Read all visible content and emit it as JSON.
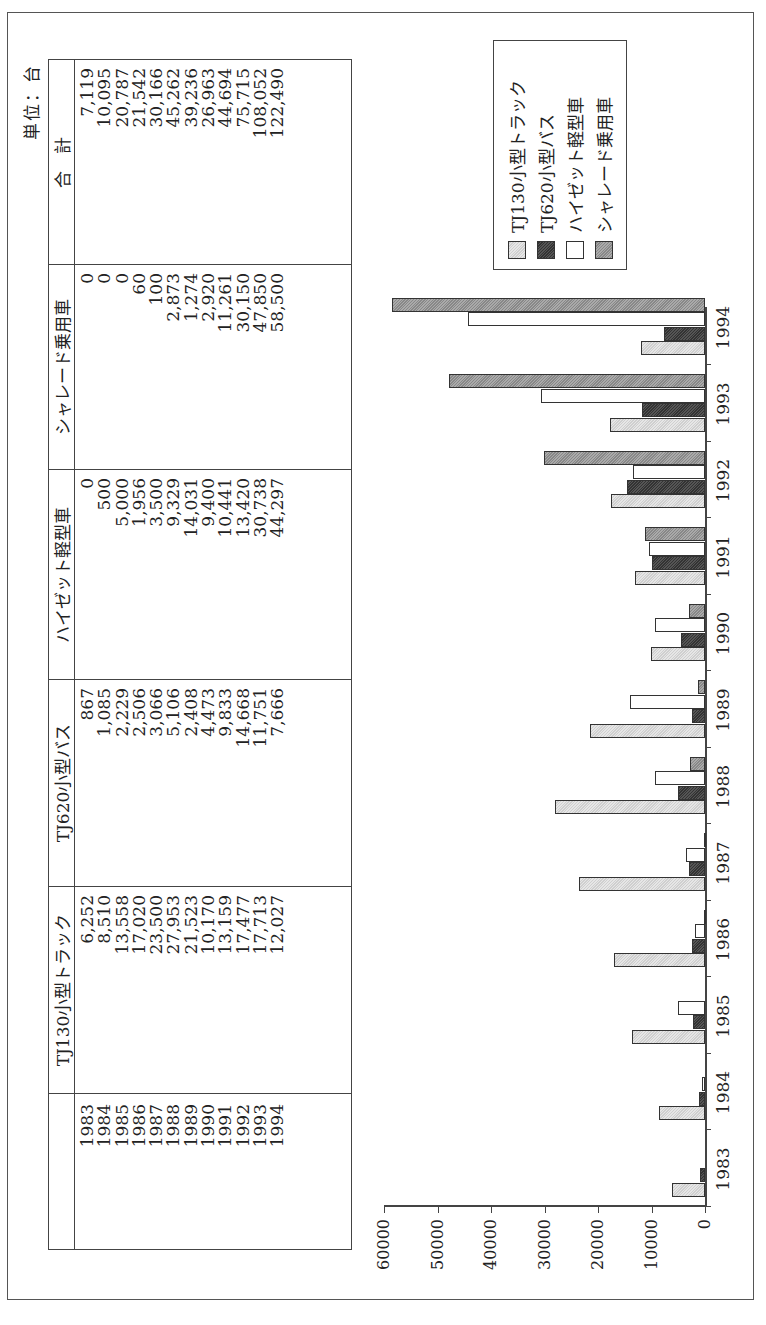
{
  "unit_label": "単位：台",
  "table": {
    "columns": [
      "",
      "TJ130小型トラック",
      "TJ620小型バス",
      "ハイゼット軽型車",
      "シャレード乗用車",
      "合　計"
    ],
    "years": [
      "1983",
      "1984",
      "1985",
      "1986",
      "1987",
      "1988",
      "1989",
      "1990",
      "1991",
      "1992",
      "1993",
      "1994"
    ],
    "tj130": [
      "6,252",
      "8,510",
      "13,558",
      "17,020",
      "23,500",
      "27,953",
      "21,523",
      "10,170",
      "13,159",
      "17,477",
      "17,713",
      "12,027"
    ],
    "tj620": [
      "867",
      "1,085",
      "2,229",
      "2,506",
      "3,066",
      "5,106",
      "2,408",
      "4,473",
      "9,833",
      "14,668",
      "11,751",
      "7,666"
    ],
    "hijet": [
      "0",
      "500",
      "5,000",
      "1,956",
      "3,500",
      "9,329",
      "14,031",
      "9,400",
      "10,441",
      "13,420",
      "30,738",
      "44,297"
    ],
    "charade": [
      "0",
      "0",
      "0",
      "60",
      "100",
      "2,873",
      "1,274",
      "2,920",
      "11,261",
      "30,150",
      "47,850",
      "58,500"
    ],
    "total": [
      "7,119",
      "10,095",
      "20,787",
      "21,542",
      "30,166",
      "45,262",
      "39,236",
      "26,963",
      "44,694",
      "75,715",
      "108,052",
      "122,490"
    ]
  },
  "legend": [
    "TJ130小型トラック",
    "TJ620小型バス",
    "ハイゼット軽型車",
    "シャレード乗用車"
  ],
  "chart_data": {
    "type": "bar",
    "title": "",
    "xlabel": "",
    "ylabel": "",
    "unit": "台",
    "categories": [
      "1983",
      "1984",
      "1985",
      "1986",
      "1987",
      "1988",
      "1989",
      "1990",
      "1991",
      "1992",
      "1993",
      "1994"
    ],
    "series": [
      {
        "name": "TJ130小型トラック",
        "values": [
          6252,
          8510,
          13558,
          17020,
          23500,
          27953,
          21523,
          10170,
          13159,
          17477,
          17713,
          12027
        ]
      },
      {
        "name": "TJ620小型バス",
        "values": [
          867,
          1085,
          2229,
          2506,
          3066,
          5106,
          2408,
          4473,
          9833,
          14668,
          11751,
          7666
        ]
      },
      {
        "name": "ハイゼット軽型車",
        "values": [
          0,
          500,
          5000,
          1956,
          3500,
          9329,
          14031,
          9400,
          10441,
          13420,
          30738,
          44297
        ]
      },
      {
        "name": "シャレード乗用車",
        "values": [
          0,
          0,
          0,
          60,
          100,
          2873,
          1274,
          2920,
          11261,
          30150,
          47850,
          58500
        ]
      }
    ],
    "yticks": [
      0,
      10000,
      20000,
      30000,
      40000,
      50000,
      60000
    ],
    "ylim": [
      0,
      60000
    ],
    "grid": false,
    "legend_position": "top-right"
  }
}
